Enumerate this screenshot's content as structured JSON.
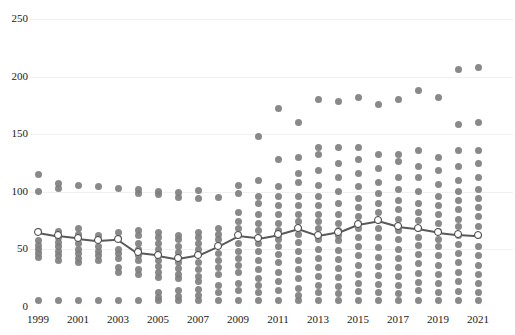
{
  "chart_data": {
    "type": "scatter",
    "title": "",
    "subtitle": "",
    "xlabel": "",
    "ylabel": "",
    "xlim": [
      1998.5,
      2021.5
    ],
    "ylim": [
      0,
      250
    ],
    "grid": true,
    "grid_axis": "y",
    "legend": null,
    "y_ticks": [
      0,
      50,
      100,
      150,
      200,
      250
    ],
    "y_tick_labels": [
      "0",
      "50",
      "100",
      "150",
      "200",
      "250"
    ],
    "x_ticks": [
      1999,
      2001,
      2003,
      2005,
      2007,
      2009,
      2011,
      2013,
      2015,
      2017,
      2019,
      2021
    ],
    "x_tick_labels": [
      "1999",
      "2001",
      "2003",
      "2005",
      "2007",
      "2009",
      "2011",
      "2013",
      "2015",
      "2017",
      "2019",
      "2021"
    ],
    "x_all_categories": [
      1999,
      2000,
      2001,
      2002,
      2003,
      2004,
      2005,
      2006,
      2007,
      2008,
      2009,
      2010,
      2011,
      2012,
      2013,
      2014,
      2015,
      2016,
      2017,
      2018,
      2019,
      2020,
      2021
    ],
    "colors": {
      "dot": "#7f7f7f",
      "median_marker_fill": "#ffffff",
      "median_marker_edge": "#3f3f3f",
      "median_line": "#595959",
      "gridline": "#f0f0f0",
      "text": "#1a1a1a",
      "background": "#ffffff"
    },
    "series": [
      {
        "name": "median",
        "type": "line",
        "marker": "open-circle",
        "x": [
          1999,
          2000,
          2001,
          2002,
          2003,
          2004,
          2005,
          2006,
          2007,
          2008,
          2009,
          2010,
          2011,
          2012,
          2013,
          2014,
          2015,
          2016,
          2017,
          2018,
          2019,
          2020,
          2021
        ],
        "values": [
          65,
          62,
          60,
          58,
          59,
          47,
          45,
          42,
          45,
          53,
          62,
          60,
          63,
          68,
          62,
          65,
          72,
          75,
          70,
          68,
          65,
          63,
          62
        ]
      },
      {
        "name": "observations",
        "type": "strip",
        "points_by_year": {
          "1999": [
            5,
            43,
            46,
            50,
            53,
            57,
            65,
            100,
            115
          ],
          "2000": [
            5,
            40,
            44,
            48,
            52,
            56,
            60,
            62,
            65,
            103,
            107
          ],
          "2001": [
            5,
            38,
            42,
            46,
            50,
            55,
            60,
            63,
            68,
            105
          ],
          "2002": [
            5,
            40,
            44,
            48,
            52,
            58,
            62,
            104
          ],
          "2003": [
            5,
            30,
            34,
            42,
            46,
            50,
            59,
            64,
            103
          ],
          "2004": [
            5,
            28,
            32,
            40,
            44,
            47,
            50,
            55,
            62,
            66,
            98,
            102
          ],
          "2005": [
            5,
            8,
            12,
            25,
            30,
            35,
            40,
            45,
            50,
            55,
            60,
            64,
            97,
            100
          ],
          "2006": [
            5,
            9,
            14,
            24,
            28,
            33,
            38,
            42,
            47,
            52,
            58,
            62,
            95,
            99
          ],
          "2007": [
            5,
            10,
            15,
            22,
            26,
            32,
            38,
            45,
            50,
            55,
            60,
            64,
            94,
            101
          ],
          "2008": [
            5,
            12,
            18,
            28,
            34,
            40,
            46,
            53,
            58,
            63,
            68,
            95
          ],
          "2009": [
            5,
            14,
            20,
            30,
            36,
            42,
            48,
            55,
            62,
            68,
            74,
            82,
            98,
            105
          ],
          "2010": [
            5,
            12,
            18,
            24,
            32,
            40,
            48,
            55,
            60,
            66,
            72,
            80,
            90,
            96,
            110,
            148
          ],
          "2011": [
            5,
            14,
            22,
            30,
            38,
            45,
            52,
            58,
            62,
            66,
            72,
            80,
            88,
            96,
            104,
            128,
            172
          ],
          "2012": [
            5,
            10,
            16,
            24,
            32,
            40,
            48,
            56,
            63,
            68,
            74,
            80,
            88,
            96,
            108,
            116,
            130,
            160
          ],
          "2013": [
            5,
            12,
            18,
            26,
            34,
            42,
            50,
            58,
            62,
            68,
            74,
            80,
            88,
            96,
            105,
            118,
            132,
            138,
            180
          ],
          "2014": [
            5,
            11,
            17,
            25,
            33,
            41,
            49,
            57,
            62,
            66,
            72,
            80,
            90,
            100,
            112,
            124,
            138,
            178
          ],
          "2015": [
            5,
            13,
            20,
            28,
            36,
            44,
            52,
            60,
            68,
            72,
            78,
            86,
            94,
            104,
            116,
            128,
            138,
            182
          ],
          "2016": [
            5,
            12,
            19,
            27,
            35,
            43,
            51,
            60,
            68,
            75,
            82,
            90,
            98,
            108,
            120,
            132,
            176
          ],
          "2017": [
            5,
            11,
            18,
            26,
            34,
            42,
            50,
            58,
            66,
            70,
            76,
            84,
            92,
            102,
            112,
            126,
            132,
            180
          ],
          "2018": [
            5,
            14,
            21,
            29,
            37,
            45,
            53,
            60,
            68,
            75,
            82,
            90,
            100,
            112,
            122,
            136,
            188
          ],
          "2019": [
            5,
            12,
            20,
            28,
            36,
            44,
            52,
            58,
            65,
            72,
            80,
            88,
            96,
            106,
            118,
            130,
            182
          ],
          "2020": [
            5,
            13,
            22,
            30,
            38,
            46,
            54,
            62,
            70,
            76,
            84,
            92,
            100,
            110,
            122,
            136,
            158,
            206
          ],
          "2021": [
            5,
            12,
            20,
            28,
            36,
            44,
            52,
            62,
            70,
            78,
            86,
            94,
            102,
            112,
            124,
            136,
            160,
            208
          ]
        }
      }
    ]
  }
}
